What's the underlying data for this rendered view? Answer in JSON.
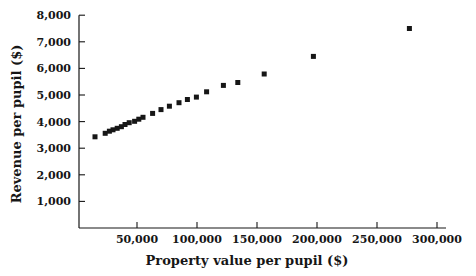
{
  "figure": {
    "background": "#ffffff",
    "ink_color": "#161616"
  },
  "chart_data": {
    "type": "scatter",
    "title": "",
    "xlabel": "Property value per pupil ($)",
    "ylabel": "Revenue per pupil ($)",
    "legend": null,
    "grid": false,
    "xlim": [
      0,
      305000
    ],
    "ylim": [
      0,
      8000
    ],
    "x_ticks": [
      50000,
      100000,
      150000,
      200000,
      250000,
      300000
    ],
    "x_tick_labels": [
      "50,000",
      "100,000",
      "150,000",
      "200,000",
      "250,000",
      "300,000"
    ],
    "y_ticks": [
      1000,
      2000,
      3000,
      4000,
      5000,
      6000,
      7000,
      8000
    ],
    "y_tick_labels": [
      "1,000",
      "2,000",
      "3,000",
      "4,000",
      "5,000",
      "6,000",
      "7,000",
      "8,000"
    ],
    "marker": "filled-square",
    "marker_color": "#161616",
    "marker_size_px": 5,
    "points": [
      [
        15000,
        3430
      ],
      [
        23500,
        3560
      ],
      [
        27000,
        3640
      ],
      [
        30000,
        3690
      ],
      [
        33500,
        3750
      ],
      [
        37000,
        3810
      ],
      [
        40000,
        3890
      ],
      [
        43500,
        3960
      ],
      [
        48000,
        4010
      ],
      [
        51500,
        4090
      ],
      [
        55000,
        4160
      ],
      [
        63000,
        4310
      ],
      [
        70000,
        4450
      ],
      [
        77000,
        4580
      ],
      [
        85000,
        4710
      ],
      [
        92000,
        4830
      ],
      [
        99500,
        4920
      ],
      [
        108000,
        5120
      ],
      [
        122000,
        5360
      ],
      [
        134000,
        5470
      ],
      [
        156000,
        5790
      ],
      [
        197000,
        6450
      ],
      [
        277000,
        7500
      ]
    ]
  }
}
